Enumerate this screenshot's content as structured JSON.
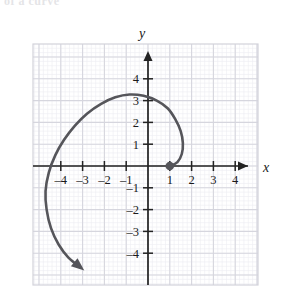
{
  "figure": {
    "title_fragment": "of a curve",
    "axis_labels": {
      "x": "x",
      "y": "y"
    },
    "x_ticks": [
      {
        "value": -4,
        "label": "–4"
      },
      {
        "value": -3,
        "label": "–3"
      },
      {
        "value": -2,
        "label": "–2"
      },
      {
        "value": -1,
        "label": "–1"
      },
      {
        "value": 1,
        "label": "1"
      },
      {
        "value": 2,
        "label": "2"
      },
      {
        "value": 3,
        "label": "3"
      },
      {
        "value": 4,
        "label": "4"
      }
    ],
    "y_ticks": [
      {
        "value": 4,
        "label": "4"
      },
      {
        "value": 3,
        "label": "3"
      },
      {
        "value": 2,
        "label": "2"
      },
      {
        "value": 1,
        "label": "1"
      },
      {
        "value": -1,
        "label": "–1"
      },
      {
        "value": -2,
        "label": "–2"
      },
      {
        "value": -3,
        "label": "–3"
      },
      {
        "value": -4,
        "label": "–4"
      }
    ],
    "colors": {
      "curve": "#55555a",
      "axis": "#232323",
      "major_grid": "#d9d9e0",
      "minor_grid": "#ececf2",
      "frame": "#d9d9e0",
      "label": "#1a1a1a"
    }
  },
  "chart_data": {
    "type": "line",
    "title": "",
    "xlabel": "x",
    "ylabel": "y",
    "xlim": [
      -5.2,
      5.0
    ],
    "ylim": [
      -5.3,
      4.8
    ],
    "grid": true,
    "grid_minor_per_cell": 5,
    "legend": null,
    "annotations": [
      {
        "kind": "start-point",
        "x": 1,
        "y": 0,
        "style": "filled-dot"
      },
      {
        "kind": "arrowhead",
        "x": -3.0,
        "y": -4.7,
        "direction": "down-right"
      }
    ],
    "series": [
      {
        "name": "spiral",
        "description": "outward spiral starting at (1,0), sweeping counterclockwise",
        "points": [
          [
            1.0,
            0.0
          ],
          [
            1.35,
            0.18
          ],
          [
            1.55,
            0.55
          ],
          [
            1.6,
            1.05
          ],
          [
            1.5,
            1.6
          ],
          [
            1.25,
            2.15
          ],
          [
            0.9,
            2.65
          ],
          [
            0.4,
            3.0
          ],
          [
            -0.2,
            3.22
          ],
          [
            -0.85,
            3.28
          ],
          [
            -1.5,
            3.15
          ],
          [
            -2.15,
            2.85
          ],
          [
            -2.8,
            2.4
          ],
          [
            -3.35,
            1.85
          ],
          [
            -3.85,
            1.2
          ],
          [
            -4.25,
            0.5
          ],
          [
            -4.55,
            -0.3
          ],
          [
            -4.7,
            -1.15
          ],
          [
            -4.65,
            -2.0
          ],
          [
            -4.45,
            -2.85
          ],
          [
            -4.1,
            -3.6
          ],
          [
            -3.65,
            -4.2
          ],
          [
            -3.1,
            -4.65
          ]
        ]
      }
    ]
  }
}
